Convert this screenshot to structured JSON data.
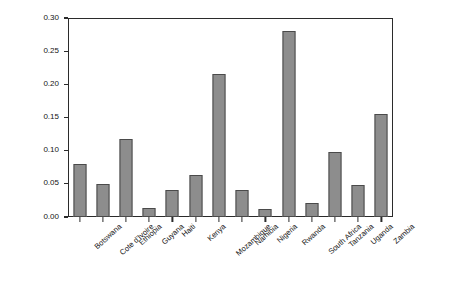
{
  "chart_data": {
    "type": "bar",
    "title": "",
    "xlabel": "",
    "ylabel": "Percentage",
    "ylim": [
      0.0,
      0.3
    ],
    "yticks": [
      "0.00",
      "0.05",
      "0.10",
      "0.15",
      "0.20",
      "0.25",
      "0.30"
    ],
    "ytick_values": [
      0.0,
      0.05,
      0.1,
      0.15,
      0.2,
      0.25,
      0.3
    ],
    "grid": false,
    "legend": null,
    "bar_color": "#8d8d8d",
    "bar_edge_color": "#4a4a4a",
    "categories": [
      "Botswana",
      "Cote d'Ivoire",
      "Ethiopia",
      "Guyana",
      "Haiti",
      "Kenya",
      "Mozambique",
      "Namibia",
      "Nigeria",
      "Rwanda",
      "South Africa",
      "Tanzania",
      "Uganda",
      "Zambia"
    ],
    "values": [
      0.08,
      0.05,
      0.118,
      0.014,
      0.04,
      0.063,
      0.215,
      0.04,
      0.012,
      0.28,
      0.021,
      0.098,
      0.048,
      0.155
    ]
  }
}
